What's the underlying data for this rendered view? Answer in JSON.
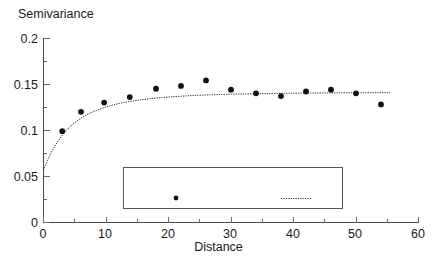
{
  "chart_data": {
    "type": "scatter",
    "title": "",
    "xlabel": "Distance",
    "ylabel": "Semivariance",
    "xlim": [
      0,
      60
    ],
    "ylim": [
      0,
      0.2
    ],
    "xticks": [
      "0",
      "10",
      "20",
      "30",
      "40",
      "50",
      "60"
    ],
    "xtick_values": [
      0,
      10,
      20,
      30,
      40,
      50,
      60
    ],
    "yticks": [
      "0",
      "0.05",
      "0.1",
      "0.15",
      "0.2"
    ],
    "ytick_values": [
      0,
      0.05,
      0.1,
      0.15,
      0.2
    ],
    "grid": false,
    "legend_position": "inside-bottom-center",
    "series": [
      {
        "name": "Classical Estimator",
        "type": "scatter",
        "marker": "filled-circle",
        "color": "#111111",
        "x": [
          3.0,
          6.0,
          9.7,
          13.8,
          18.0,
          22.0,
          26.0,
          30.0,
          34.0,
          38.0,
          42.0,
          46.0,
          50.0,
          54.0
        ],
        "y": [
          0.099,
          0.12,
          0.13,
          0.136,
          0.145,
          0.148,
          0.154,
          0.144,
          0.14,
          0.137,
          0.142,
          0.144,
          0.14,
          0.128
        ]
      },
      {
        "name": "Exponential Model",
        "type": "line",
        "style": "dotted",
        "color": "#3a3a3a",
        "nugget": 0.057,
        "sill": 0.144,
        "range": 10.5,
        "x": [
          0.0,
          0.7,
          1.4,
          2.1,
          2.8,
          3.5,
          4.2,
          5.0,
          6.0,
          7.0,
          8.0,
          9.0,
          10.0,
          11.5,
          13.0,
          15.0,
          17.0,
          19.0,
          21.0,
          24.0,
          27.0,
          30.0,
          34.0,
          38.0,
          42.0,
          46.0,
          50.0,
          55.5
        ],
        "y": [
          0.057,
          0.0684,
          0.078,
          0.0861,
          0.0929,
          0.0987,
          0.1036,
          0.1083,
          0.1131,
          0.117,
          0.1203,
          0.123,
          0.1253,
          0.1281,
          0.1303,
          0.1325,
          0.1342,
          0.1355,
          0.1365,
          0.1377,
          0.1385,
          0.1391,
          0.1396,
          0.14,
          0.1403,
          0.1405,
          0.1406,
          0.1408
        ]
      }
    ],
    "legend": {
      "entries": [
        {
          "label": "Classical Estimator",
          "marker": "filled-circle"
        },
        {
          "label": "Exponential Model",
          "marker": "dotted-line"
        }
      ]
    }
  },
  "colors": {
    "background": "#ffffff",
    "axis": "#4a4a4a",
    "point": "#111111",
    "model_line": "#3a3a3a",
    "legend_border": "#555555",
    "text": "#1a1a1a"
  }
}
